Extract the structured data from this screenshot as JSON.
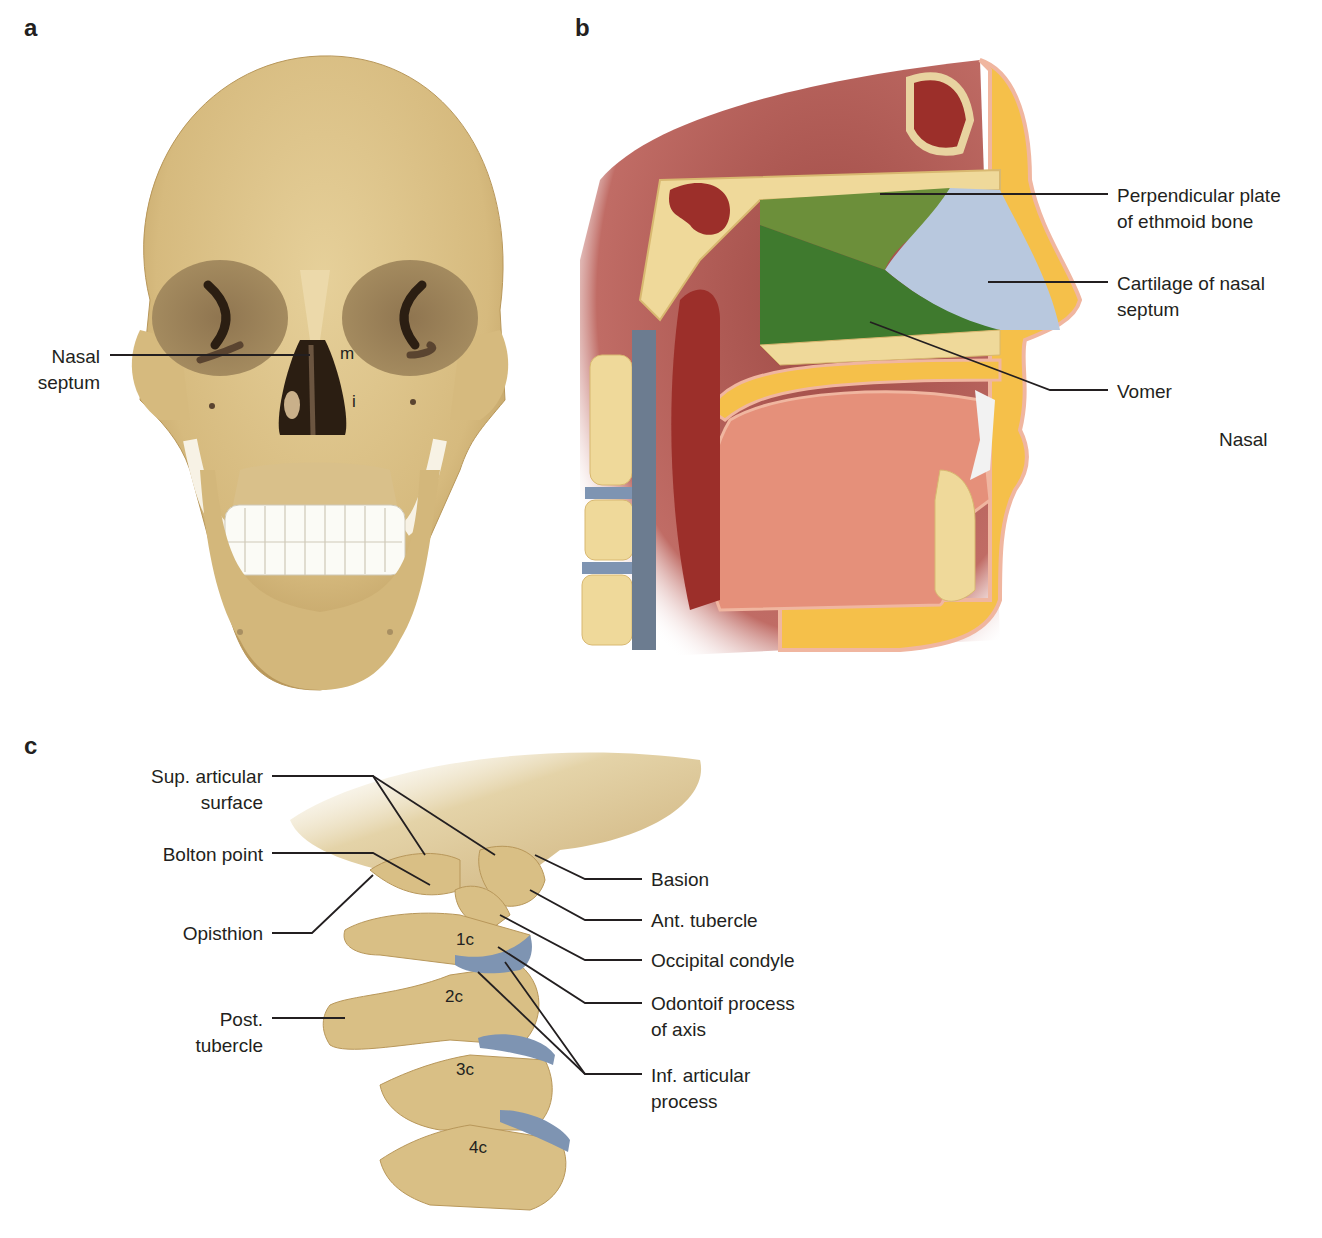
{
  "panels": {
    "a": {
      "letter": "a",
      "labels": {
        "nasal_septum": "Nasal\nseptum",
        "m": "m",
        "i": "i"
      }
    },
    "b": {
      "letter": "b",
      "labels": {
        "perpendicular_plate": "Perpendicular plate\nof ethmoid bone",
        "cartilage": "Cartilage of nasal\nseptum",
        "vomer": "Vomer",
        "nasal": "Nasal"
      }
    },
    "c": {
      "letter": "c",
      "left_labels": {
        "sup_articular": "Sup. articular\nsurface",
        "bolton": "Bolton point",
        "opisthion": "Opisthion",
        "post_tubercle": "Post.\ntubercle"
      },
      "right_labels": {
        "basion": "Basion",
        "ant_tubercle": "Ant. tubercle",
        "occipital_condyle": "Occipital condyle",
        "odontoid": "Odontoif process\nof axis",
        "inf_articular": "Inf. articular\nprocess"
      },
      "vertebrae": [
        "1c",
        "2c",
        "3c",
        "4c"
      ]
    }
  },
  "colors": {
    "bone": "#d9bf85",
    "bone_light": "#e8d3a0",
    "bone_dark": "#b8975a",
    "muscle": "#9c2f2a",
    "tongue": "#e5907a",
    "fat": "#f5c04a",
    "ethmoid_green": "#6c8f3a",
    "vomer_green": "#3f7a2e",
    "cartilage_blue": "#b8c8de",
    "disc_blue": "#7e94b2",
    "line": "#231f20"
  }
}
